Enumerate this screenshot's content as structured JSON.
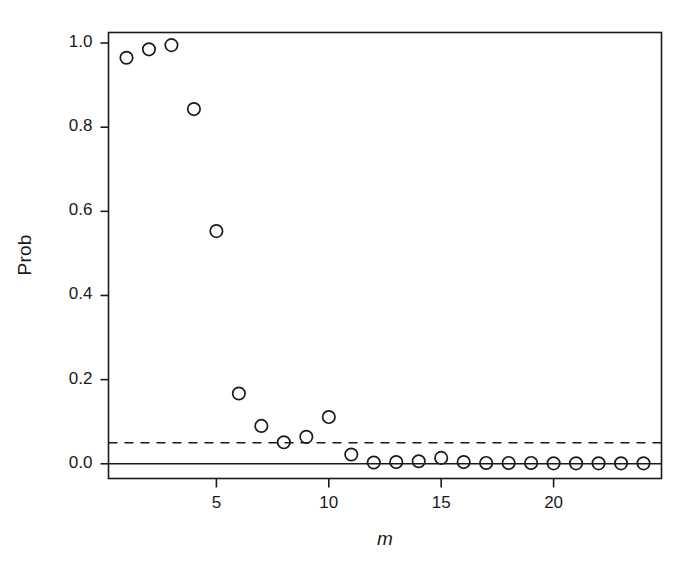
{
  "figure": {
    "background": "#ffffff",
    "foreground": "#1a1a1a"
  },
  "axes": {
    "ylabel": "Prob",
    "xlabel": "m",
    "y_ticks": [
      "0.0",
      "0.2",
      "0.4",
      "0.6",
      "0.8",
      "1.0"
    ],
    "x_ticks": [
      "5",
      "10",
      "15",
      "20"
    ]
  },
  "chart_data": {
    "type": "scatter",
    "title": "",
    "xlabel": "m",
    "ylabel": "Prob",
    "xlim": [
      0.2,
      24.8
    ],
    "ylim": [
      -0.035,
      1.025
    ],
    "xticks": [
      5,
      10,
      15,
      20
    ],
    "yticks": [
      0.0,
      0.2,
      0.4,
      0.6,
      0.8,
      1.0
    ],
    "grid": false,
    "legend": null,
    "marker": "open-circle",
    "marker_color": "#1a1a1a",
    "x": [
      1,
      2,
      3,
      4,
      5,
      6,
      7,
      8,
      9,
      10,
      11,
      12,
      13,
      14,
      15,
      16,
      17,
      18,
      19,
      20,
      21,
      22,
      23,
      24
    ],
    "y": [
      0.965,
      0.985,
      0.995,
      0.843,
      0.553,
      0.167,
      0.09,
      0.051,
      0.064,
      0.111,
      0.022,
      0.003,
      0.004,
      0.006,
      0.014,
      0.004,
      0.002,
      0.002,
      0.002,
      0.001,
      0.001,
      0.001,
      0.001,
      0.001
    ],
    "annotations": [
      {
        "type": "hline",
        "value": 0.05,
        "style": "dashed",
        "color": "#1a1a1a",
        "label": "0.05 threshold"
      }
    ]
  }
}
